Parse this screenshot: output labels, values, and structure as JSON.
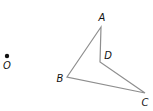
{
  "diagram": {
    "type": "geometry",
    "points": {
      "O": {
        "label": "O",
        "x": 7,
        "y": 56,
        "label_x": 7,
        "label_y": 69
      },
      "A": {
        "label": "A",
        "x": 101,
        "y": 27,
        "label_x": 102,
        "label_y": 21
      },
      "B": {
        "label": "B",
        "x": 67,
        "y": 77,
        "label_x": 60,
        "label_y": 82
      },
      "C": {
        "label": "C",
        "x": 145,
        "y": 93,
        "label_x": 145,
        "label_y": 106
      },
      "D": {
        "label": "D",
        "x": 100,
        "y": 62,
        "label_x": 108,
        "label_y": 59
      }
    },
    "polygon": [
      "A",
      "B",
      "C",
      "D"
    ],
    "colors": {
      "edge": "#8e8e8e",
      "label": "#111111",
      "dot": "#111111"
    }
  }
}
